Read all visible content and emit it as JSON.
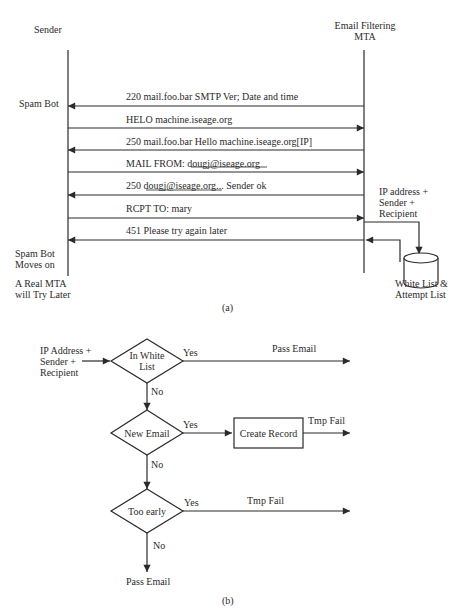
{
  "part_a": {
    "caption": "(a)",
    "sender_label": "Sender",
    "mta_label_line1": "Email Filtering",
    "mta_label_line2": "MTA",
    "left_notes": {
      "spam_bot": "Spam Bot",
      "moves_on_line1": "Spam Bot",
      "moves_on_line2": "Moves on",
      "real_mta_line1": "A Real MTA",
      "real_mta_line2": "will Try Later"
    },
    "messages": [
      {
        "text": "220 mail.foo.bar SMTP Ver; Date and time",
        "direction": "to-sender"
      },
      {
        "text": "HELO machine.iseage.org",
        "direction": "to-mta"
      },
      {
        "text": "250 mail.foo.bar Hello machine.iseage.org[IP]",
        "direction": "to-sender"
      },
      {
        "text_prefix": "MAIL FROM: ",
        "text_link": "dougj@iseage.org",
        "text_suffix": "",
        "direction": "to-mta"
      },
      {
        "text_prefix": "250 ",
        "text_link": "dougj@iseage.org",
        "text_suffix": "... Sender ok",
        "direction": "to-sender"
      },
      {
        "text": "RCPT TO: mary",
        "direction": "to-mta"
      },
      {
        "text": "451 Please try again later",
        "direction": "to-sender"
      }
    ],
    "lookup_label_line1": "IP address +",
    "lookup_label_line2": "Sender +",
    "lookup_label_line3": "Recipient",
    "db_label_line1": "White List &",
    "db_label_line2": "Attempt List"
  },
  "part_b": {
    "caption": "(b)",
    "input_line1": "IP Address +",
    "input_line2": "Sender +",
    "input_line3": "Recipient",
    "decision1_line1": "In White",
    "decision1_line2": "List",
    "decision1_yes": "Yes",
    "decision1_no": "No",
    "decision1_outcome": "Pass Email",
    "decision2": "New Email",
    "decision2_yes": "Yes",
    "decision2_no": "No",
    "process": "Create Record",
    "process_outcome": "Tmp Fail",
    "decision3": "Too early",
    "decision3_yes": "Yes",
    "decision3_no": "No",
    "decision3_outcome": "Tmp Fail",
    "final_outcome": "Pass Email"
  }
}
